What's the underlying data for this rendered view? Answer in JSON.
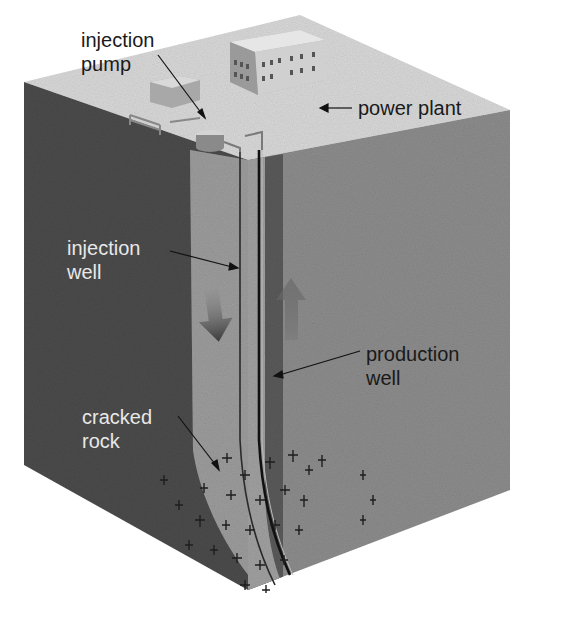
{
  "figure": {
    "colors": {
      "surface_top": "#d6d6d6",
      "left_face": "#4a4a4a",
      "right_face": "#8a8a8a",
      "fractured_zone": "#9a9a9a",
      "well_line": "#222222",
      "label_dark": "#1a1a1a",
      "label_light": "#e8e8e8"
    }
  },
  "labels": {
    "injection_pump": {
      "line1": "injection",
      "line2": "pump"
    },
    "power_plant": "power plant",
    "injection_well": {
      "line1": "injection",
      "line2": "well"
    },
    "production_well": {
      "line1": "production",
      "line2": "well"
    },
    "cracked_rock": {
      "line1": "cracked",
      "line2": "rock"
    }
  }
}
